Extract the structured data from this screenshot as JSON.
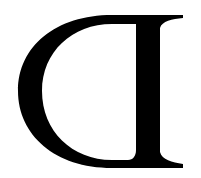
{
  "glyph": {
    "character": "reversed D",
    "colors": {
      "foreground": "#000000",
      "background": "#ffffff"
    }
  }
}
